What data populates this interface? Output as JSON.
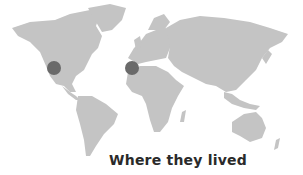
{
  "map": {
    "style": "grey world map",
    "land_color": "#c4c4c4",
    "markers": [
      {
        "name": "western-north-america",
        "cx": 54,
        "cy": 68,
        "r": 7,
        "color": "#6a6a6a"
      },
      {
        "name": "iberian-peninsula",
        "cx": 132,
        "cy": 68,
        "r": 7,
        "color": "#6a6a6a"
      }
    ]
  },
  "caption": "Where they lived"
}
